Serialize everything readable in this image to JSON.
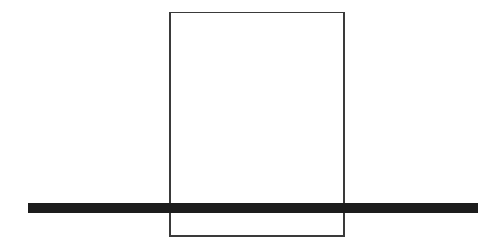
{
  "canvas": {
    "width": 500,
    "height": 249,
    "background_color": "#ffffff"
  },
  "figure": {
    "title": "Rectangle intersected by horizontal bar",
    "shapes": [
      {
        "name": "rectangle",
        "type": "rect",
        "x": 170,
        "y": 12.5,
        "width": 174,
        "height": 223.5,
        "fill": "none",
        "stroke_color": "#3a3a3a",
        "stroke_width": 1.6
      },
      {
        "name": "horizontal-bar",
        "type": "rect",
        "x": 28,
        "y": 203,
        "width": 450,
        "height": 9.5,
        "fill": "#1c1c1c",
        "stroke_color": "none",
        "stroke_width": 0
      }
    ]
  },
  "chart_data": {
    "type": "table",
    "title": "Rectangle intersected by horizontal bar",
    "xlabel": "",
    "ylabel": "",
    "columns": [
      "shape",
      "left",
      "top",
      "width",
      "height",
      "color"
    ],
    "rows": [
      [
        "rectangle outline",
        170,
        12.5,
        174,
        223.5,
        "#3a3a3a"
      ],
      [
        "horizontal bar",
        28,
        203,
        450,
        9.5,
        "#1c1c1c"
      ]
    ]
  }
}
